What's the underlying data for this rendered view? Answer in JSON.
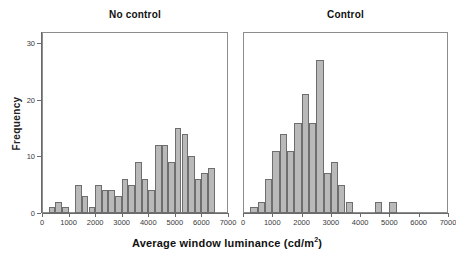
{
  "chart_data": {
    "type": "bar",
    "title": "",
    "xlabel": "Average window luminance (cd/m²)",
    "ylabel": "Frequency",
    "xlim": [
      0,
      7000
    ],
    "ylim": [
      0,
      32
    ],
    "xticks": [
      0,
      1000,
      2000,
      3000,
      4000,
      5000,
      6000,
      7000
    ],
    "xtick_labels": [
      "0",
      "1000",
      "2000",
      "3000",
      "4000",
      "5000",
      "6000",
      "7000"
    ],
    "yticks": [
      0,
      10,
      20,
      30
    ],
    "ytick_labels": [
      "0",
      "10",
      "20",
      "30"
    ],
    "grid": false,
    "legend": "none",
    "bin_width": 250,
    "bar_color": "#b9b9b9",
    "bar_edge_color": "#6e6e6e",
    "panels": [
      {
        "label": "No control",
        "bins": [
          {
            "x0": 250,
            "x1": 500,
            "value": 1
          },
          {
            "x0": 500,
            "x1": 750,
            "value": 2
          },
          {
            "x0": 750,
            "x1": 1000,
            "value": 1
          },
          {
            "x0": 1000,
            "x1": 1250,
            "value": 0
          },
          {
            "x0": 1250,
            "x1": 1500,
            "value": 5
          },
          {
            "x0": 1500,
            "x1": 1750,
            "value": 3
          },
          {
            "x0": 1750,
            "x1": 2000,
            "value": 1
          },
          {
            "x0": 2000,
            "x1": 2250,
            "value": 5
          },
          {
            "x0": 2250,
            "x1": 2500,
            "value": 4
          },
          {
            "x0": 2500,
            "x1": 2750,
            "value": 4
          },
          {
            "x0": 2750,
            "x1": 3000,
            "value": 3
          },
          {
            "x0": 3000,
            "x1": 3250,
            "value": 6
          },
          {
            "x0": 3250,
            "x1": 3500,
            "value": 5
          },
          {
            "x0": 3500,
            "x1": 3750,
            "value": 9
          },
          {
            "x0": 3750,
            "x1": 4000,
            "value": 6
          },
          {
            "x0": 4000,
            "x1": 4250,
            "value": 4
          },
          {
            "x0": 4250,
            "x1": 4500,
            "value": 12
          },
          {
            "x0": 4500,
            "x1": 4750,
            "value": 12
          },
          {
            "x0": 4750,
            "x1": 5000,
            "value": 9
          },
          {
            "x0": 5000,
            "x1": 5250,
            "value": 15
          },
          {
            "x0": 5250,
            "x1": 5500,
            "value": 14
          },
          {
            "x0": 5500,
            "x1": 5750,
            "value": 10
          },
          {
            "x0": 5750,
            "x1": 6000,
            "value": 6
          },
          {
            "x0": 6000,
            "x1": 6250,
            "value": 7
          },
          {
            "x0": 6250,
            "x1": 6500,
            "value": 8
          }
        ]
      },
      {
        "label": "Control",
        "bins": [
          {
            "x0": 250,
            "x1": 500,
            "value": 1
          },
          {
            "x0": 500,
            "x1": 750,
            "value": 2
          },
          {
            "x0": 750,
            "x1": 1000,
            "value": 6
          },
          {
            "x0": 1000,
            "x1": 1250,
            "value": 11
          },
          {
            "x0": 1250,
            "x1": 1500,
            "value": 14
          },
          {
            "x0": 1500,
            "x1": 1750,
            "value": 11
          },
          {
            "x0": 1750,
            "x1": 2000,
            "value": 16
          },
          {
            "x0": 2000,
            "x1": 2250,
            "value": 21
          },
          {
            "x0": 2250,
            "x1": 2500,
            "value": 16
          },
          {
            "x0": 2500,
            "x1": 2750,
            "value": 27
          },
          {
            "x0": 2750,
            "x1": 3000,
            "value": 7
          },
          {
            "x0": 3000,
            "x1": 3250,
            "value": 9
          },
          {
            "x0": 3250,
            "x1": 3500,
            "value": 5
          },
          {
            "x0": 3500,
            "x1": 3750,
            "value": 2
          },
          {
            "x0": 4500,
            "x1": 4750,
            "value": 2
          },
          {
            "x0": 5000,
            "x1": 5250,
            "value": 2
          }
        ]
      }
    ]
  },
  "axes": {
    "ylabel": "Frequency",
    "xlabel_prefix": "Average window luminance (cd/m",
    "xlabel_sup": "2",
    "xlabel_suffix": ")"
  },
  "panel_titles": {
    "left": "No control",
    "right": "Control"
  }
}
